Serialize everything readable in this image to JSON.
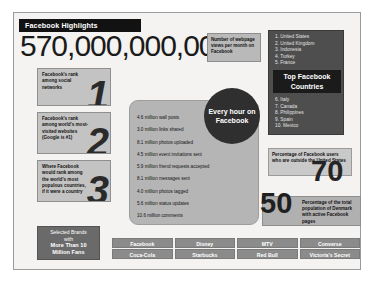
{
  "header": {
    "title": "Facebook Highlights"
  },
  "hero": {
    "big_number": "570,000,000,000",
    "callout": "Number of webpage views per month on Facebook"
  },
  "top_countries": {
    "title": "Top Facebook Countries",
    "first_half": [
      "1. United States",
      "2. United Kingdom",
      "3. Indonesia",
      "4. Turkey",
      "5. France"
    ],
    "second_half": [
      "6. Italy",
      "7. Canada",
      "8. Philippines",
      "9. Spain",
      "10. Mexico"
    ]
  },
  "ranks": [
    {
      "caption": "Facebook's rank among social networks",
      "digit": "1"
    },
    {
      "caption": "Facebook's rank among world's most-visited websites (Google is #1)",
      "digit": "2"
    },
    {
      "caption": "Where Facebook would rank among the world's most populous countries, if it were a country",
      "digit": "3"
    }
  ],
  "hourly": {
    "circle_label": "Every hour on Facebook",
    "stats": [
      "4.6 million wall posts",
      "3.0 million links shared",
      "8.1 million photos uploaded",
      "4.5 million event invitations sent",
      "5.9 million friend requests accepted",
      "8.1 million messages sent",
      "4.0 million photos tagged",
      "5.6 million status updates",
      "10.6 million comments"
    ]
  },
  "percentages": [
    {
      "value": "70",
      "caption": "Percentage of Facebook users who are outside the United States"
    },
    {
      "value": "50",
      "caption": "Percentage of the total population of Denmark with active Facebook pages"
    }
  ],
  "brands": {
    "label_line1": "Selected Brands",
    "label_line2": "with",
    "label_line3": "More Than 10",
    "label_line4": "Million Fans",
    "cells": [
      "Facebook",
      "Disney",
      "MTV",
      "Converse",
      "Coca-Cola",
      "Starbucks",
      "Red Bull",
      "Victoria's Secret"
    ]
  }
}
